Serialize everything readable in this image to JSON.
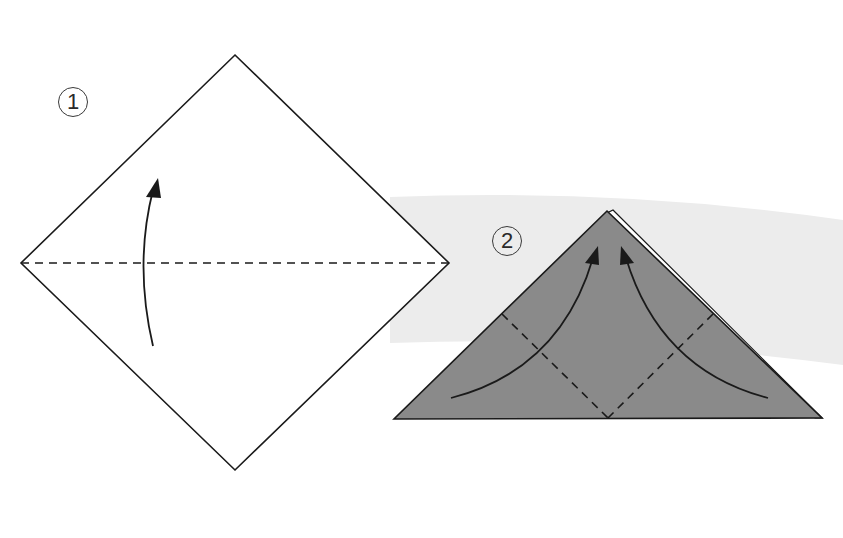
{
  "diagram": {
    "type": "origami-folding-instructions",
    "colors": {
      "background": "#ffffff",
      "band": "#ececec",
      "paper_front": "#ffffff",
      "paper_colored": "#8a8a8a",
      "line": "#1a1a1a"
    },
    "steps": [
      {
        "number": "1",
        "shape": "square-diamond",
        "vertices": {
          "top": [
            235,
            55
          ],
          "right": [
            449,
            263
          ],
          "bottom": [
            235,
            470
          ],
          "left": [
            21,
            263
          ]
        },
        "fold_lines": [
          {
            "type": "valley-dashed",
            "from": [
              21,
              263
            ],
            "to": [
              449,
              263
            ]
          }
        ],
        "arrows": [
          {
            "direction": "up",
            "tail": [
              153,
              346
            ],
            "tip": [
              158,
              178
            ]
          }
        ],
        "instruction": "Fold the bottom corner up to the top along the horizontal diagonal"
      },
      {
        "number": "2",
        "shape": "triangle",
        "vertices": {
          "apex": [
            607,
            211
          ],
          "left": [
            394,
            419
          ],
          "right": [
            822,
            418
          ]
        },
        "fold_lines": [
          {
            "type": "valley-dashed",
            "from": [
              502,
              314
            ],
            "to": [
              608,
              418
            ]
          },
          {
            "type": "valley-dashed",
            "from": [
              713,
              314
            ],
            "to": [
              608,
              418
            ]
          }
        ],
        "arrows": [
          {
            "direction": "up-right",
            "tail": [
              451,
              398
            ],
            "tip": [
              598,
              246
            ]
          },
          {
            "direction": "up-left",
            "tail": [
              768,
              398
            ],
            "tip": [
              621,
              246
            ]
          }
        ],
        "instruction": "Fold both bottom corners up to the top point"
      }
    ]
  }
}
